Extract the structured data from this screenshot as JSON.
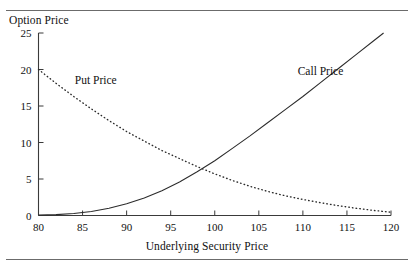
{
  "figure": {
    "top_rule": "horizontal-rule",
    "bottom_rule": "horizontal-rule"
  },
  "chart_data": {
    "type": "line",
    "title": "",
    "ylabel": "Option Price",
    "xlabel": "Underlying Security Price",
    "xlim": [
      80,
      120
    ],
    "ylim": [
      0,
      25
    ],
    "xticks": [
      80,
      85,
      90,
      95,
      100,
      105,
      110,
      115,
      120
    ],
    "xtick_labels": [
      "80",
      "85",
      "90",
      "95",
      "100",
      "105",
      "110",
      "115",
      "120"
    ],
    "yticks": [
      0,
      5,
      10,
      15,
      20,
      25
    ],
    "ytick_labels": [
      "0",
      "5",
      "10",
      "15",
      "20",
      "25"
    ],
    "grid": false,
    "legend_position": "inline-annotations",
    "annotations": [
      {
        "text": "Put Price",
        "x": 86.5,
        "y": 18.0
      },
      {
        "text": "Call Price",
        "x": 112.0,
        "y": 19.2
      }
    ],
    "x": [
      80,
      82,
      84,
      86,
      88,
      90,
      92,
      94,
      96,
      98,
      100,
      102,
      104,
      106,
      108,
      110,
      112,
      114,
      116,
      118,
      120
    ],
    "series": [
      {
        "name": "Call Price",
        "style": "solid",
        "values": [
          0.05,
          0.12,
          0.28,
          0.55,
          0.98,
          1.6,
          2.4,
          3.4,
          4.6,
          6.0,
          7.5,
          9.2,
          10.9,
          12.7,
          14.5,
          16.3,
          18.2,
          20.1,
          22.0,
          23.9,
          25.8
        ]
      },
      {
        "name": "Put Price",
        "style": "dotted",
        "values": [
          20.0,
          18.1,
          16.3,
          14.6,
          13.0,
          11.5,
          10.2,
          8.9,
          7.8,
          6.7,
          5.7,
          4.8,
          4.0,
          3.3,
          2.7,
          2.2,
          1.75,
          1.35,
          1.0,
          0.7,
          0.45
        ]
      }
    ]
  }
}
